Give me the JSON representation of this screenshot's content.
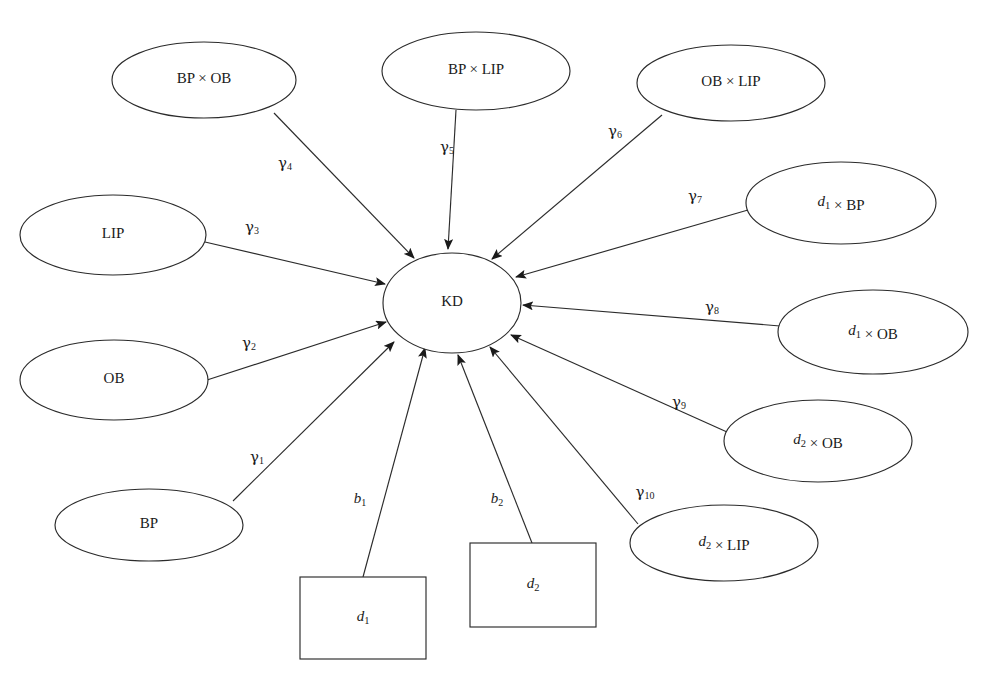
{
  "diagram": {
    "background_color": "#ffffff",
    "stroke_color": "#2b2b2b",
    "text_color": "#1a1a1a",
    "width": 982,
    "height": 674,
    "center": {
      "id": "KD",
      "label": "KD",
      "shape": "ellipse",
      "cx": 452,
      "cy": 303,
      "rx": 69,
      "ry": 50
    },
    "nodes": [
      {
        "id": "bp_x_ob",
        "label": "BP × OB",
        "shape": "ellipse",
        "cx": 204,
        "cy": 80,
        "rx": 92,
        "ry": 38
      },
      {
        "id": "bp_x_lip",
        "label": "BP × LIP",
        "shape": "ellipse",
        "cx": 476,
        "cy": 71,
        "rx": 94,
        "ry": 39
      },
      {
        "id": "ob_x_lip",
        "label": "OB × LIP",
        "shape": "ellipse",
        "cx": 731,
        "cy": 83,
        "rx": 94,
        "ry": 38
      },
      {
        "id": "d1_x_bp",
        "label": "d₁ × BP",
        "shape": "ellipse",
        "cx": 841,
        "cy": 203,
        "rx": 95,
        "ry": 41
      },
      {
        "id": "d1_x_ob",
        "label": "d₁ × OB",
        "shape": "ellipse",
        "cx": 873,
        "cy": 332,
        "rx": 95,
        "ry": 42
      },
      {
        "id": "d2_x_ob",
        "label": "d₂ × OB",
        "shape": "ellipse",
        "cx": 818,
        "cy": 441,
        "rx": 94,
        "ry": 41
      },
      {
        "id": "d2_x_lip",
        "label": "d₂ × LIP",
        "shape": "ellipse",
        "cx": 724,
        "cy": 543,
        "rx": 94,
        "ry": 38
      },
      {
        "id": "lip",
        "label": "LIP",
        "shape": "ellipse",
        "cx": 113,
        "cy": 235,
        "rx": 93,
        "ry": 40
      },
      {
        "id": "ob",
        "label": "OB",
        "shape": "ellipse",
        "cx": 114,
        "cy": 380,
        "rx": 94,
        "ry": 40
      },
      {
        "id": "bp",
        "label": "BP",
        "shape": "ellipse",
        "cx": 149,
        "cy": 525,
        "rx": 94,
        "ry": 36
      },
      {
        "id": "d1",
        "label": "d₁",
        "shape": "rect",
        "x": 300,
        "y": 577,
        "w": 126,
        "h": 82
      },
      {
        "id": "d2",
        "label": "d₂",
        "shape": "rect",
        "x": 470,
        "y": 543,
        "w": 126,
        "h": 84
      }
    ],
    "edges": [
      {
        "id": "e_g1",
        "from": "bp",
        "to": "KD",
        "coefficient": "γ₁",
        "symbol": "γ",
        "subscript": "1",
        "label_x": 257,
        "label_y": 458,
        "x1": 233,
        "y1": 501,
        "x2": 394,
        "y2": 342
      },
      {
        "id": "e_g2",
        "from": "ob",
        "to": "KD",
        "coefficient": "γ₂",
        "symbol": "γ",
        "subscript": "2",
        "label_x": 249,
        "label_y": 344,
        "x1": 207,
        "y1": 380,
        "x2": 386,
        "y2": 322
      },
      {
        "id": "e_g3",
        "from": "lip",
        "to": "KD",
        "coefficient": "γ₃",
        "symbol": "γ",
        "subscript": "3",
        "label_x": 252,
        "label_y": 228,
        "x1": 205,
        "y1": 242,
        "x2": 385,
        "y2": 284
      },
      {
        "id": "e_g4",
        "from": "bp_x_ob",
        "to": "KD",
        "coefficient": "γ₄",
        "symbol": "γ",
        "subscript": "4",
        "label_x": 285,
        "label_y": 164,
        "x1": 274,
        "y1": 113,
        "x2": 414,
        "y2": 258
      },
      {
        "id": "e_g5",
        "from": "bp_x_lip",
        "to": "KD",
        "coefficient": "γ₅",
        "symbol": "γ",
        "subscript": "5",
        "label_x": 447,
        "label_y": 148,
        "x1": 456,
        "y1": 110,
        "x2": 448,
        "y2": 249
      },
      {
        "id": "e_g6",
        "from": "ob_x_lip",
        "to": "KD",
        "coefficient": "γ₆",
        "symbol": "γ",
        "subscript": "6",
        "label_x": 615,
        "label_y": 132,
        "x1": 662,
        "y1": 115,
        "x2": 492,
        "y2": 259
      },
      {
        "id": "e_g7",
        "from": "d1_x_bp",
        "to": "KD",
        "coefficient": "γ₇",
        "symbol": "γ",
        "subscript": "7",
        "label_x": 695,
        "label_y": 197,
        "x1": 748,
        "y1": 210,
        "x2": 516,
        "y2": 277
      },
      {
        "id": "e_g8",
        "from": "d1_x_ob",
        "to": "KD",
        "coefficient": "γ₈",
        "symbol": "γ",
        "subscript": "8",
        "label_x": 712,
        "label_y": 308,
        "x1": 780,
        "y1": 326,
        "x2": 523,
        "y2": 305
      },
      {
        "id": "e_g9",
        "from": "d2_x_ob",
        "to": "KD",
        "coefficient": "γ₉",
        "symbol": "γ",
        "subscript": "9",
        "label_x": 679,
        "label_y": 403,
        "x1": 727,
        "y1": 432,
        "x2": 511,
        "y2": 335
      },
      {
        "id": "e_g10",
        "from": "d2_x_lip",
        "to": "KD",
        "coefficient": "γ₁₀",
        "symbol": "γ",
        "subscript": "10",
        "label_x": 645,
        "label_y": 493,
        "x1": 638,
        "y1": 524,
        "x2": 490,
        "y2": 347
      },
      {
        "id": "e_b1",
        "from": "d1",
        "to": "KD",
        "coefficient": "b₁",
        "symbol": "b",
        "subscript": "1",
        "label_x": 360,
        "label_y": 500,
        "x1": 363,
        "y1": 577,
        "x2": 425,
        "y2": 348
      },
      {
        "id": "e_b2",
        "from": "d2",
        "to": "KD",
        "coefficient": "b₂",
        "symbol": "b",
        "subscript": "2",
        "label_x": 497,
        "label_y": 500,
        "x1": 532,
        "y1": 543,
        "x2": 458,
        "y2": 355
      }
    ]
  }
}
